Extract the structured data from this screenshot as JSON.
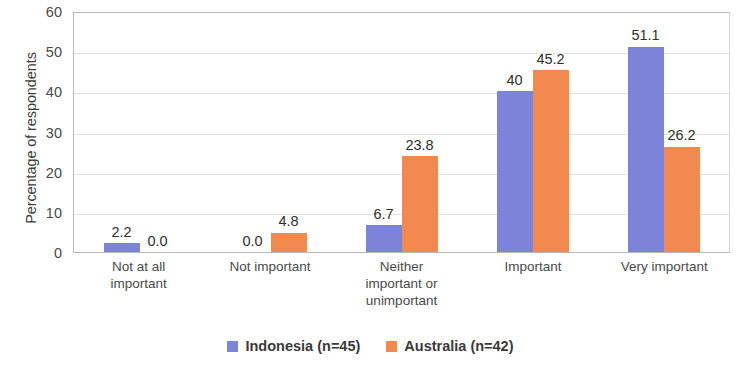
{
  "chart_data": {
    "type": "bar",
    "title": "",
    "subtitle": "",
    "xlabel": "",
    "ylabel": "Percentage of respondents",
    "ylim": [
      0,
      60
    ],
    "yticks": [
      60,
      50,
      40,
      30,
      20,
      10,
      0
    ],
    "grid": true,
    "legend_position": "bottom",
    "categories": [
      "Not at all important",
      "Not important",
      "Neither important or unimportant",
      "Important",
      "Very important"
    ],
    "category_lines": [
      [
        "Not at all",
        "important"
      ],
      [
        "Not important"
      ],
      [
        "Neither",
        "important or",
        "unimportant"
      ],
      [
        "Important"
      ],
      [
        "Very important"
      ]
    ],
    "series": [
      {
        "name": "Indonesia (n=45)",
        "color": "#7b84d8",
        "values": [
          2.2,
          0.0,
          6.7,
          40,
          51.1
        ],
        "labels": [
          "2.2",
          "0.0",
          "6.7",
          "40",
          "51.1"
        ]
      },
      {
        "name": "Australia (n=42)",
        "color": "#f2894e",
        "values": [
          0.0,
          4.8,
          23.8,
          45.2,
          26.2
        ],
        "labels": [
          "0.0",
          "4.8",
          "23.8",
          "45.2",
          "26.2"
        ]
      }
    ]
  },
  "legend": {
    "items": [
      {
        "label": "Indonesia (n=45)",
        "color": "#7b84d8"
      },
      {
        "label": "Australia (n=42)",
        "color": "#f2894e"
      }
    ]
  }
}
